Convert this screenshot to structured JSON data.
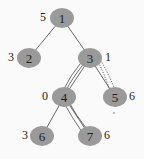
{
  "diagram": {
    "type": "tree",
    "node_color": "#9a9a9a",
    "nodes": [
      {
        "id": "1",
        "label": "1",
        "weight": "5",
        "x": 62,
        "y": 18
      },
      {
        "id": "2",
        "label": "2",
        "weight": "3",
        "x": 29,
        "y": 58
      },
      {
        "id": "3",
        "label": "3",
        "weight": "1",
        "x": 90,
        "y": 58
      },
      {
        "id": "4",
        "label": "4",
        "weight": "0",
        "x": 64,
        "y": 97
      },
      {
        "id": "5",
        "label": "5",
        "weight": "6",
        "x": 115,
        "y": 97
      },
      {
        "id": "6",
        "label": "6",
        "weight": "3",
        "x": 42,
        "y": 136
      },
      {
        "id": "7",
        "label": "7",
        "weight": "6",
        "x": 90,
        "y": 136
      }
    ],
    "edges": [
      {
        "from": "1",
        "to": "2"
      },
      {
        "from": "1",
        "to": "3"
      },
      {
        "from": "3",
        "to": "4"
      },
      {
        "from": "3",
        "to": "5"
      },
      {
        "from": "4",
        "to": "6"
      },
      {
        "from": "4",
        "to": "7"
      }
    ],
    "paths": [
      {
        "description": "path 3-4-7 (solid double)"
      },
      {
        "description": "path 3-5 (dotted loop)"
      }
    ]
  }
}
